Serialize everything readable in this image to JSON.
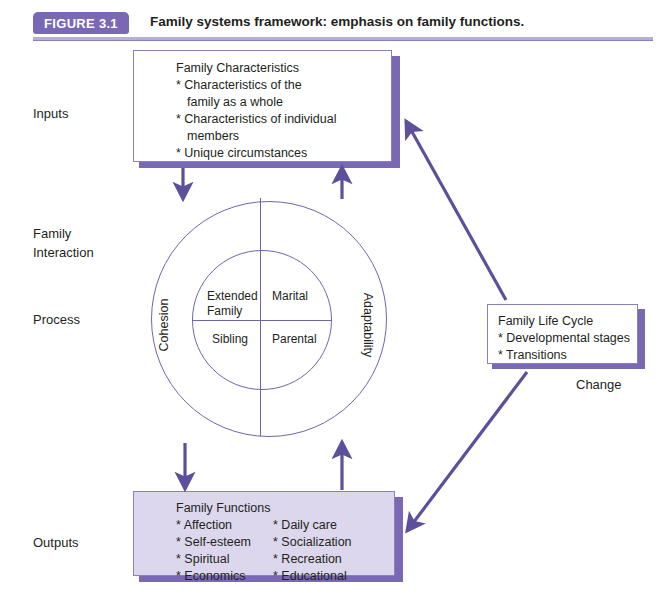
{
  "figure": {
    "badge": "FIGURE 3.1",
    "title": "Family systems framework: emphasis on family functions.",
    "accent_color": "#7a68b4",
    "rule_color": "#b7aed6",
    "arrow_color": "#5c4f9c",
    "box_border_color": "#8b80bd",
    "outputs_fill_color": "#dcd7ec",
    "circle_stroke_color": "#6f66aa"
  },
  "stage_labels": {
    "inputs": "Inputs",
    "family_interaction": "Family\nInteraction",
    "process": "Process",
    "outputs": "Outputs",
    "change": "Change"
  },
  "boxes": {
    "inputs": {
      "heading": "Family Characteristics",
      "items": [
        {
          "line1": "* Characteristics of the",
          "line2": "family as a whole"
        },
        {
          "line1": "* Characteristics of individual",
          "line2": "members"
        },
        {
          "line1": "* Unique circumstances",
          "line2": ""
        }
      ]
    },
    "life_cycle": {
      "heading": "Family Life Cycle",
      "items": [
        "* Developmental stages",
        "* Transitions"
      ]
    },
    "outputs": {
      "heading": "Family Functions",
      "column_left": [
        "* Affection",
        "* Self-esteem",
        "* Spiritual",
        "* Economics"
      ],
      "column_right": [
        "* Daily care",
        "* Socialization",
        "* Recreation",
        "* Educational"
      ]
    }
  },
  "circle": {
    "outer_left_label": "Cohesion",
    "outer_right_label": "Adaptability",
    "quadrants": {
      "top_left": "Extended\nFamily",
      "top_right": "Marital",
      "bottom_left": "Sibling",
      "bottom_right": "Parental"
    }
  }
}
